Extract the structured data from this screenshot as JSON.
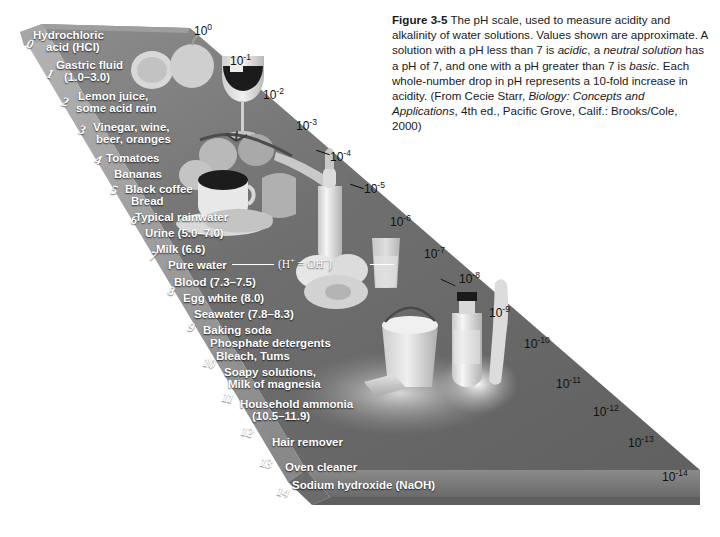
{
  "figure": {
    "label": "Figure 3-5",
    "caption_parts": [
      {
        "t": "The pH scale, used to measure acidity and alkalinity of water solutions. Values shown are approximate. A solution with a pH less than 7 is ",
        "s": "normal"
      },
      {
        "t": "acidic",
        "s": "italic"
      },
      {
        "t": ", a ",
        "s": "normal"
      },
      {
        "t": "neutral solution",
        "s": "italic"
      },
      {
        "t": " has a pH of 7, and one with a pH greater than 7 is ",
        "s": "normal"
      },
      {
        "t": "basic",
        "s": "italic"
      },
      {
        "t": ". Each whole-number drop in pH represents a 10-fold increase in acidity. (From Cecie Starr, ",
        "s": "normal"
      },
      {
        "t": "Biology: Concepts and Applications",
        "s": "italic"
      },
      {
        "t": ", 4th ed., Pacific Grove, Calif.: Brooks/Cole, 2000)",
        "s": "normal"
      }
    ],
    "caption_plain": "Figure 3-5 The pH scale, used to measure acidity and alkalinity of water solutions. Values shown are approximate. A solution with a pH less than 7 is acidic, a neutral solution has a pH of 7, and one with a pH greater than 7 is basic. Each whole-number drop in pH represents a 10-fold increase in acidity. (From Cecie Starr, Biology: Concepts and Applications, 4th ed., Pacific Grove, Calif.: Brooks/Cole, 2000)"
  },
  "chart_data": {
    "type": "bar",
    "title": "The pH scale",
    "xlabel": "pH",
    "ylabel": "H+ concentration (moles per liter)",
    "ylim": [
      0,
      14
    ],
    "grid": false,
    "legend": "none",
    "categories": [
      "0",
      "1",
      "2",
      "3",
      "4",
      "5",
      "6",
      "7",
      "8",
      "9",
      "10",
      "11",
      "12",
      "13",
      "14"
    ],
    "values": [
      0,
      1,
      2,
      3,
      4,
      5,
      6,
      7,
      8,
      9,
      10,
      11,
      12,
      13,
      14
    ],
    "concentration_labels": [
      "10^0",
      "10^-1",
      "10^-2",
      "10^-3",
      "10^-4",
      "10^-5",
      "10^-6",
      "10^-7",
      "10^-8",
      "10^-9",
      "10^-10",
      "10^-11",
      "10^-12",
      "10^-13",
      "10^-14"
    ],
    "neutral_point": 7,
    "annotations": [
      "Pure water (H+ = OH-) at pH 7",
      "acidic below 7",
      "basic above 7"
    ],
    "examples": [
      {
        "ph": 0,
        "label": "Hydrochloric acid (HCl)"
      },
      {
        "ph": 1,
        "label": "Gastric fluid (1.0-3.0)"
      },
      {
        "ph": 2,
        "label": "Lemon juice, some acid rain"
      },
      {
        "ph": 3,
        "label": "Vinegar, wine, beer, oranges"
      },
      {
        "ph": 4,
        "label": "Tomatoes"
      },
      {
        "ph": 4.5,
        "label": "Bananas"
      },
      {
        "ph": 5,
        "label": "Black coffee"
      },
      {
        "ph": 5,
        "label": "Bread"
      },
      {
        "ph": 5.6,
        "label": "Typical rainwater"
      },
      {
        "ph": 6,
        "label": "Urine (5.0-7.0)"
      },
      {
        "ph": 6.6,
        "label": "Milk (6.6)"
      },
      {
        "ph": 7,
        "label": "Pure water"
      },
      {
        "ph": 7.4,
        "label": "Blood (7.3-7.5)"
      },
      {
        "ph": 8,
        "label": "Egg white (8.0)"
      },
      {
        "ph": 8.1,
        "label": "Seawater (7.8-8.3)"
      },
      {
        "ph": 8.4,
        "label": "Baking soda"
      },
      {
        "ph": 9,
        "label": "Phosphate detergents"
      },
      {
        "ph": 9.2,
        "label": "Bleach, Tums"
      },
      {
        "ph": 9.8,
        "label": "Soapy solutions, Milk of magnesia"
      },
      {
        "ph": 11,
        "label": "Household ammonia (10.5-11.9)"
      },
      {
        "ph": 12,
        "label": "Hair remover"
      },
      {
        "ph": 13,
        "label": "Oven cleaner"
      },
      {
        "ph": 14,
        "label": "Sodium hydroxide (NaOH)"
      }
    ]
  },
  "scale_numbers": [
    {
      "n": "0",
      "x": 27,
      "y": 36
    },
    {
      "n": "1",
      "x": 47,
      "y": 66
    },
    {
      "n": "2",
      "x": 62,
      "y": 94
    },
    {
      "n": "3",
      "x": 79,
      "y": 122
    },
    {
      "n": "4",
      "x": 95,
      "y": 152
    },
    {
      "n": "5",
      "x": 111,
      "y": 182
    },
    {
      "n": "6",
      "x": 131,
      "y": 212
    },
    {
      "n": "7",
      "x": 150,
      "y": 248
    },
    {
      "n": "8",
      "x": 168,
      "y": 283
    },
    {
      "n": "9",
      "x": 188,
      "y": 319
    },
    {
      "n": "10",
      "x": 203,
      "y": 355
    },
    {
      "n": "11",
      "x": 222,
      "y": 390
    },
    {
      "n": "12",
      "x": 241,
      "y": 424
    },
    {
      "n": "13",
      "x": 260,
      "y": 455
    },
    {
      "n": "14",
      "x": 277,
      "y": 484
    }
  ],
  "labels": [
    {
      "text": "Hydrochloric",
      "x": 33,
      "y": 29,
      "align": "left"
    },
    {
      "text": "acid (HCl)",
      "x": 46,
      "y": 41,
      "align": "left"
    },
    {
      "text": "Gastric fluid",
      "x": 56,
      "y": 59,
      "align": "left"
    },
    {
      "text": "(1.0–3.0)",
      "x": 64,
      "y": 71,
      "align": "left"
    },
    {
      "text": "Lemon juice,",
      "x": 78,
      "y": 90,
      "align": "left"
    },
    {
      "text": "some acid rain",
      "x": 76,
      "y": 102,
      "align": "left"
    },
    {
      "text": "Vinegar, wine,",
      "x": 93,
      "y": 121,
      "align": "left"
    },
    {
      "text": "beer, oranges",
      "x": 96,
      "y": 133,
      "align": "left"
    },
    {
      "text": "Tomatoes",
      "x": 106,
      "y": 152,
      "align": "left"
    },
    {
      "text": "Bananas",
      "x": 114,
      "y": 168,
      "align": "left"
    },
    {
      "text": "Black coffee",
      "x": 125,
      "y": 183,
      "align": "left"
    },
    {
      "text": "Bread",
      "x": 131,
      "y": 195,
      "align": "left"
    },
    {
      "text": "Typical rainwater",
      "x": 135,
      "y": 211,
      "align": "left"
    },
    {
      "text": "Urine (5.0–7.0)",
      "x": 145,
      "y": 227,
      "align": "left"
    },
    {
      "text": "Milk (6.6)",
      "x": 156,
      "y": 243,
      "align": "left"
    },
    {
      "text": "Pure water",
      "x": 168,
      "y": 259,
      "align": "left"
    },
    {
      "text": "Blood (7.3–7.5)",
      "x": 174,
      "y": 276,
      "align": "left"
    },
    {
      "text": "Egg white (8.0)",
      "x": 183,
      "y": 292,
      "align": "left"
    },
    {
      "text": "Seawater (7.8–8.3)",
      "x": 194,
      "y": 308,
      "align": "left"
    },
    {
      "text": "Baking soda",
      "x": 203,
      "y": 324,
      "align": "left"
    },
    {
      "text": "Phosphate detergents",
      "x": 210,
      "y": 337,
      "align": "left"
    },
    {
      "text": "Bleach, Tums",
      "x": 216,
      "y": 350,
      "align": "left"
    },
    {
      "text": "Soapy solutions,",
      "x": 224,
      "y": 366,
      "align": "left"
    },
    {
      "text": "Milk of magnesia",
      "x": 228,
      "y": 378,
      "align": "left"
    },
    {
      "text": "Household ammonia",
      "x": 240,
      "y": 398,
      "align": "left"
    },
    {
      "text": "(10.5–11.9)",
      "x": 252,
      "y": 410,
      "align": "left"
    },
    {
      "text": "Hair remover",
      "x": 272,
      "y": 436,
      "align": "left"
    },
    {
      "text": "Oven cleaner",
      "x": 285,
      "y": 461,
      "align": "left"
    },
    {
      "text": "Sodium hydroxide (NaOH)",
      "x": 292,
      "y": 479,
      "align": "left"
    }
  ],
  "power_labels": [
    {
      "base": "10",
      "exp": "0",
      "x": 194,
      "y": 22
    },
    {
      "base": "10",
      "exp": "-1",
      "x": 230,
      "y": 52
    },
    {
      "base": "10",
      "exp": "-2",
      "x": 263,
      "y": 86
    },
    {
      "base": "10",
      "exp": "-3",
      "x": 296,
      "y": 117
    },
    {
      "base": "10",
      "exp": "-4",
      "x": 330,
      "y": 148
    },
    {
      "base": "10",
      "exp": "-5",
      "x": 364,
      "y": 180
    },
    {
      "base": "10",
      "exp": "-6",
      "x": 390,
      "y": 213
    },
    {
      "base": "10",
      "exp": "-7",
      "x": 424,
      "y": 245
    },
    {
      "base": "10",
      "exp": "-8",
      "x": 459,
      "y": 270
    },
    {
      "base": "10",
      "exp": "-9",
      "x": 489,
      "y": 304
    },
    {
      "base": "10",
      "exp": "-10",
      "x": 524,
      "y": 335
    },
    {
      "base": "10",
      "exp": "-11",
      "x": 556,
      "y": 375
    },
    {
      "base": "10",
      "exp": "-12",
      "x": 593,
      "y": 403
    },
    {
      "base": "10",
      "exp": "-13",
      "x": 628,
      "y": 434
    },
    {
      "base": "10",
      "exp": "-14",
      "x": 662,
      "y": 468
    }
  ],
  "formula": {
    "prefix": "(H",
    "sup1": "+",
    "middle": " = OH",
    "sup2": "−",
    "suffix": ")"
  },
  "colors": {
    "wedge_top": "#6e6e6e",
    "wedge_top_light": "#8a8a8a",
    "wedge_bevel": "#9b9b9b",
    "wedge_side": "#5a5a5a",
    "wedge_base": "#7d7d7d",
    "label_text": "#ffffff",
    "power_text": "#111111",
    "caption_text": "#1a1a1a",
    "background": "#ffffff"
  }
}
